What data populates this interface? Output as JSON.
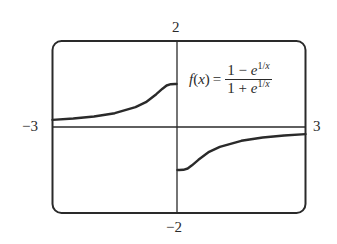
{
  "chart_data": {
    "type": "line",
    "title": "",
    "function": {
      "name": "f(x)",
      "numerator": "1 − e^{1/x}",
      "denominator": "1 + e^{1/x}",
      "label_lhs_func": "f",
      "label_lhs_var": "x",
      "label_eq": "=",
      "num_lead": "1 − ",
      "den_lead": "1 + ",
      "base": "e",
      "exp_num": "1/",
      "exp_var": "x"
    },
    "xlim": [
      -3,
      3
    ],
    "ylim": [
      -2,
      2
    ],
    "xlabel": "",
    "ylabel": "",
    "tick_labels": {
      "top": "2",
      "bottom": "−2",
      "left": "−3",
      "right": "3"
    },
    "grid": false,
    "legend": "none",
    "series": [
      {
        "name": "left branch (x < 0)",
        "x": [
          -3,
          -2.5,
          -2,
          -1.5,
          -1,
          -0.75,
          -0.5,
          -0.35,
          -0.25,
          -0.15,
          -0.05
        ],
        "values": [
          0.165,
          0.197,
          0.245,
          0.322,
          0.462,
          0.576,
          0.762,
          0.89,
          0.964,
          0.996,
          1.0
        ]
      },
      {
        "name": "right branch (x > 0)",
        "x": [
          0.05,
          0.15,
          0.25,
          0.35,
          0.5,
          0.75,
          1,
          1.5,
          2,
          2.5,
          3
        ],
        "values": [
          -1.0,
          -0.996,
          -0.964,
          -0.89,
          -0.762,
          -0.576,
          -0.462,
          -0.322,
          -0.245,
          -0.197,
          -0.165
        ]
      }
    ],
    "asymptotes": {
      "horizontal": 0,
      "jump_at_x": 0,
      "left_limit": 1,
      "right_limit": -1
    }
  },
  "colors": {
    "ink": "#2a2a2a",
    "background": "#ffffff"
  }
}
